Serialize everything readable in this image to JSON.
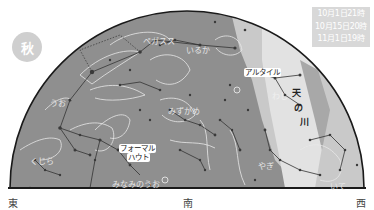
{
  "map": {
    "season_badge": "秋",
    "time_box": {
      "lines": [
        "10月1日21時",
        "10月15日20時",
        "11月1日19時"
      ]
    },
    "directions": {
      "east": "東",
      "south": "南",
      "west": "西"
    },
    "star_labels": {
      "altair": "アルタイル",
      "fomalhaut_line1": "フォーマル",
      "fomalhaut_line2": "ハウト"
    },
    "milky_way": {
      "char1": "天",
      "char2": "の",
      "char3": "川"
    },
    "constellation_labels": {
      "aquila": "わし",
      "pegasus": "ペガスス",
      "delphinus": "いるか",
      "cetus": "くじら",
      "pisces": "うお",
      "capricornus": "やぎ",
      "aquarius": "みずがめ",
      "sagittarius": "いて",
      "piscis_austrinus": "みなみのうお"
    },
    "colors": {
      "sky": "#8f8f8f",
      "milky_way": "#c9c9c9",
      "milky_way_core": "#e2e2e2",
      "horizon": "#1a1a1a",
      "star": "#3a3a3a",
      "figure_lines": "#e8e8e8"
    }
  }
}
